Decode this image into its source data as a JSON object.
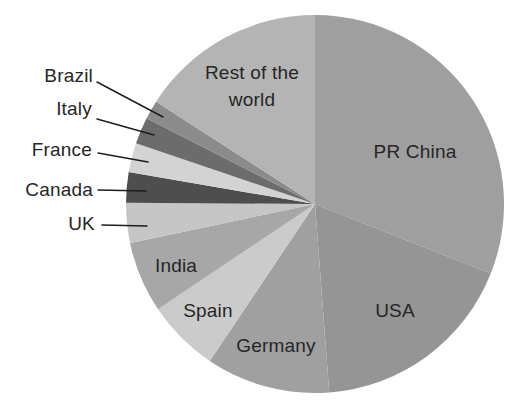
{
  "page": {
    "background_color": "#ffffff",
    "text_color": "#262626"
  },
  "chart_data": {
    "type": "pie",
    "title": "",
    "legend": "none",
    "direction": "clockwise",
    "start_angle_deg": 0,
    "values_unit": "percent of total, estimated from slice arc angles (no numeric labels are shown in the chart)",
    "grid": false,
    "slices": [
      {
        "label": "PR China",
        "value": 31.0,
        "color": "#9f9f9f",
        "label_placement": "inside"
      },
      {
        "label": "USA",
        "value": 17.8,
        "color": "#959595",
        "label_placement": "inside"
      },
      {
        "label": "Germany",
        "value": 10.6,
        "color": "#a0a0a0",
        "label_placement": "inside"
      },
      {
        "label": "Spain",
        "value": 6.2,
        "color": "#cbcbcb",
        "label_placement": "inside"
      },
      {
        "label": "India",
        "value": 6.1,
        "color": "#a7a7a7",
        "label_placement": "inside"
      },
      {
        "label": "UK",
        "value": 3.4,
        "color": "#c6c6c6",
        "label_placement": "outside-left-with-leader-line"
      },
      {
        "label": "Canada",
        "value": 2.6,
        "color": "#4e4e4e",
        "label_placement": "outside-left-with-leader-line"
      },
      {
        "label": "France",
        "value": 2.5,
        "color": "#d3d3d3",
        "label_placement": "outside-left-with-leader-line"
      },
      {
        "label": "Italy",
        "value": 2.3,
        "color": "#6c6c6c",
        "label_placement": "outside-left-with-leader-line"
      },
      {
        "label": "Brazil",
        "value": 1.6,
        "color": "#8b8b8b",
        "label_placement": "outside-left-with-leader-line"
      },
      {
        "label": "Rest of the world",
        "value": 15.9,
        "color": "#b4b4b4",
        "label_placement": "inside"
      }
    ]
  }
}
